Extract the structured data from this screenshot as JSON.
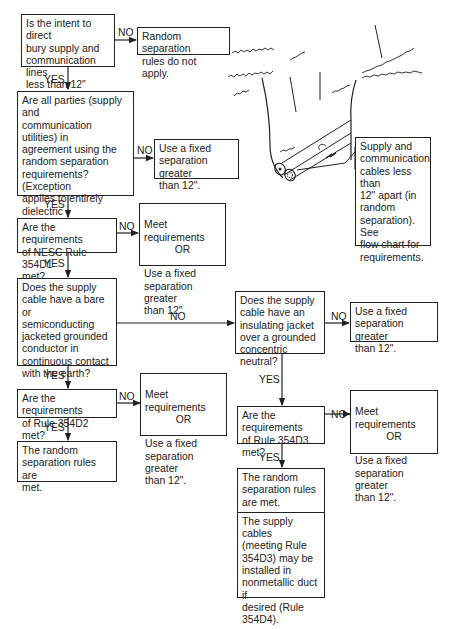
{
  "diagram": {
    "type": "flowchart"
  },
  "labels": {
    "yes": "YES",
    "no": "NO",
    "or": "OR"
  },
  "nodes": {
    "q1": "Is the intent to direct\nbury supply and\ncommunication lines\nless than 12\" apart?",
    "q1_no": "Random separation\nrules do not apply.",
    "q2": "Are all parties (supply and\ncommunication utilities) in\nagreement using the\nrandom separation\nrequirements? (Exception\napplies to entirely dielectric\nfiber-optic communication\ncables.)",
    "q2_no": "Use a fixed\nseparation greater\nthan 12\".",
    "q3": "Are the requirements\nof NESC Rule 354D1\nmet?",
    "q3_no_a": "Meet requirements",
    "q3_no_b": "Use a fixed\nseparation greater\nthan 12\".",
    "q4": "Does the supply\ncable have a bare or\nsemiconducting\njacketed grounded\nconductor in\ncontinuous contact\nwith the earth?",
    "q5": "Are the requirements\nof Rule 354D2 met?",
    "q5_no_a": "Meet requirements",
    "q5_no_b": "Use a fixed\nseparation greater\nthan 12\".",
    "q5_yes": "The random\nseparation rules are\nmet.",
    "q6": "Does the supply\ncable have an\ninsulating jacket\nover a grounded\nconcentric neutral?",
    "q6_no": "Use a fixed\nseparation greater\nthan 12\".",
    "q7": "Are the\nrequirements\nof Rule 354D3 met?",
    "q7_no_a": "Meet requirements",
    "q7_no_b": "Use a fixed\nseparation greater\nthan 12\".",
    "q7_yes": "The random\nseparation rules\nare met.",
    "q7_note": "The supply cables\n(meeting Rule\n354D3) may be\ninstalled in\nnonmetallic duct if\ndesired (Rule\n354D4)."
  },
  "illustration": {
    "callout": "Supply and\ncommunication\ncables less than\n12\" apart (in\nrandom\nseparation). See\nflow chart for\nrequirements."
  },
  "colors": {
    "line": "#222222",
    "background": "#ffffff"
  }
}
